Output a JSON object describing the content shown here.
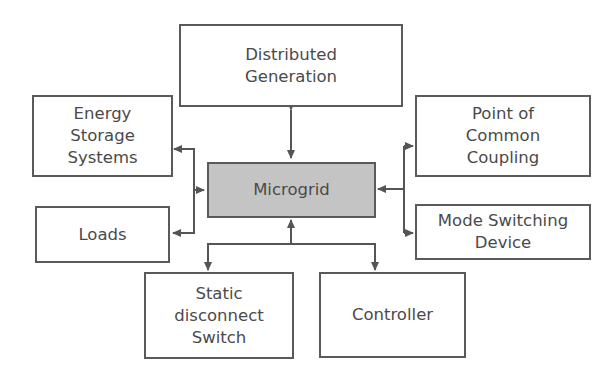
{
  "diagram": {
    "center": {
      "label": "Microgrid",
      "fill": "#c4c4c4"
    },
    "nodes": {
      "distributed_generation": {
        "label": "Distributed\nGeneration"
      },
      "energy_storage": {
        "label": "Energy\nStorage\nSystems"
      },
      "loads": {
        "label": "Loads"
      },
      "pcc": {
        "label": "Point of\nCommon\nCoupling"
      },
      "mode_switch": {
        "label": "Mode Switching\nDevice"
      },
      "static_switch": {
        "label": "Static\ndisconnect\nSwitch"
      },
      "controller": {
        "label": "Controller"
      }
    },
    "edges": [
      {
        "from": "Microgrid",
        "to": "Distributed Generation",
        "direction": "bidirectional"
      },
      {
        "from": "Microgrid",
        "to": "Energy Storage Systems",
        "direction": "bidirectional"
      },
      {
        "from": "Microgrid",
        "to": "Loads",
        "direction": "bidirectional"
      },
      {
        "from": "Point of Common Coupling / Mode Switching Device",
        "to": "Microgrid",
        "direction": "bidirectional"
      },
      {
        "from": "Microgrid",
        "to": "Static disconnect Switch / Controller",
        "direction": "bidirectional"
      }
    ],
    "line_color": "#555555"
  }
}
